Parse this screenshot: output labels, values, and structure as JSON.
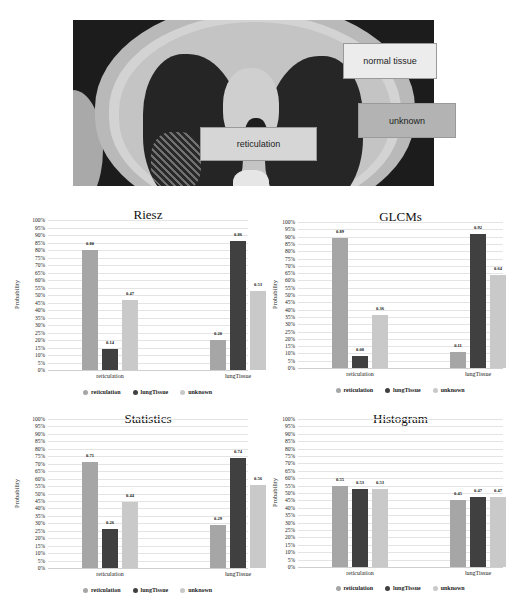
{
  "ct_image": {
    "labels": {
      "normal": "normal tissue",
      "unknown": "unknown",
      "reticulation": "reticulation"
    }
  },
  "colors": {
    "reticulation": "#a6a6a6",
    "lungTissue": "#404040",
    "unknown": "#c9c9c9"
  },
  "chart_data": [
    {
      "type": "bar",
      "title": "Riesz",
      "xlabel": "",
      "ylabel": "Probability",
      "ylim": [
        0,
        1
      ],
      "yticks": [
        "100%",
        "95%",
        "90%",
        "85%",
        "80%",
        "75%",
        "70%",
        "65%",
        "60%",
        "55%",
        "50%",
        "45%",
        "40%",
        "35%",
        "30%",
        "25%",
        "20%",
        "15%",
        "10%",
        "5%",
        "0%"
      ],
      "categories": [
        "reticulation",
        "lungTissue"
      ],
      "series": [
        {
          "name": "reticulation",
          "values": [
            0.8,
            0.2
          ],
          "labels": [
            "0.80",
            "0.20"
          ]
        },
        {
          "name": "lungTissue",
          "values": [
            0.14,
            0.86
          ],
          "labels": [
            "0.14",
            "0.86"
          ]
        },
        {
          "name": "unknown",
          "values": [
            0.47,
            0.53
          ],
          "labels": [
            "0.47",
            "0.53"
          ]
        }
      ],
      "legend": [
        "reticulation",
        "lungTissue",
        "unknown"
      ],
      "legend_position": "bottom",
      "grid": true
    },
    {
      "type": "bar",
      "title": "GLCMs",
      "xlabel": "",
      "ylabel": "Probability",
      "ylim": [
        0,
        1
      ],
      "yticks": [
        "100%",
        "95%",
        "90%",
        "85%",
        "80%",
        "75%",
        "70%",
        "65%",
        "60%",
        "55%",
        "50%",
        "45%",
        "40%",
        "35%",
        "30%",
        "25%",
        "20%",
        "15%",
        "10%",
        "5%",
        "0%"
      ],
      "categories": [
        "reticulation",
        "lungTissue"
      ],
      "series": [
        {
          "name": "reticulation",
          "values": [
            0.89,
            0.11
          ],
          "labels": [
            "0.89",
            "0.11"
          ]
        },
        {
          "name": "lungTissue",
          "values": [
            0.08,
            0.92
          ],
          "labels": [
            "0.08",
            "0.92"
          ]
        },
        {
          "name": "unknown",
          "values": [
            0.36,
            0.64
          ],
          "labels": [
            "0.36",
            "0.64"
          ]
        }
      ],
      "legend": [
        "reticulation",
        "lungTissue",
        "unknown"
      ],
      "legend_position": "bottom",
      "grid": true
    },
    {
      "type": "bar",
      "title": "Statistics",
      "xlabel": "",
      "ylabel": "Probability",
      "ylim": [
        0,
        1
      ],
      "yticks": [
        "100%",
        "95%",
        "90%",
        "85%",
        "80%",
        "75%",
        "70%",
        "65%",
        "60%",
        "55%",
        "50%",
        "45%",
        "40%",
        "35%",
        "30%",
        "25%",
        "20%",
        "15%",
        "10%",
        "5%",
        "0%"
      ],
      "categories": [
        "reticulation",
        "lungTissue"
      ],
      "series": [
        {
          "name": "reticulation",
          "values": [
            0.71,
            0.29
          ],
          "labels": [
            "0.71",
            "0.29"
          ]
        },
        {
          "name": "lungTissue",
          "values": [
            0.26,
            0.74
          ],
          "labels": [
            "0.26",
            "0.74"
          ]
        },
        {
          "name": "unknown",
          "values": [
            0.44,
            0.56
          ],
          "labels": [
            "0.44",
            "0.56"
          ]
        }
      ],
      "legend": [
        "reticulation",
        "lungTissue",
        "unknown"
      ],
      "legend_position": "bottom",
      "grid": true
    },
    {
      "type": "bar",
      "title": "Histogram",
      "xlabel": "",
      "ylabel": "Probability",
      "ylim": [
        0,
        1
      ],
      "yticks": [
        "100%",
        "95%",
        "90%",
        "85%",
        "80%",
        "75%",
        "70%",
        "65%",
        "60%",
        "55%",
        "50%",
        "45%",
        "40%",
        "35%",
        "30%",
        "25%",
        "20%",
        "15%",
        "10%",
        "5%",
        "0%"
      ],
      "categories": [
        "reticulation",
        "lungTissue"
      ],
      "series": [
        {
          "name": "reticulation",
          "values": [
            0.55,
            0.45
          ],
          "labels": [
            "0.55",
            "0.45"
          ]
        },
        {
          "name": "lungTissue",
          "values": [
            0.53,
            0.47
          ],
          "labels": [
            "0.53",
            "0.47"
          ]
        },
        {
          "name": "unknown",
          "values": [
            0.53,
            0.47
          ],
          "labels": [
            "0.53",
            "0.47"
          ]
        }
      ],
      "legend": [
        "reticulation",
        "lungTissue",
        "unknown"
      ],
      "legend_position": "bottom",
      "grid": true
    }
  ]
}
